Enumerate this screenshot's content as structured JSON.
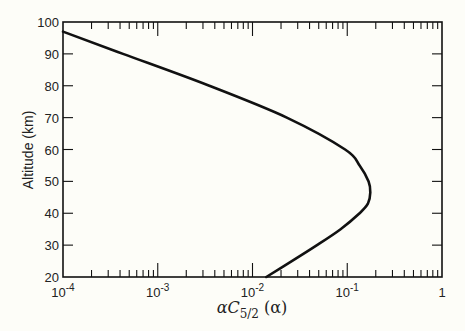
{
  "chart_data": {
    "type": "line",
    "title": "",
    "xlabel": "αC5/2(α)",
    "xlabel_parts": {
      "main": "αC",
      "sub": "5/2",
      "arg": " (α)"
    },
    "ylabel": "Altitude (km)",
    "xscale": "log",
    "xlim": [
      0.0001,
      1
    ],
    "ylim": [
      20,
      100
    ],
    "grid": false,
    "legend": null,
    "x_tick_labels": [
      {
        "base": "10",
        "exp": "-4",
        "value": 0.0001
      },
      {
        "base": "10",
        "exp": "-3",
        "value": 0.001
      },
      {
        "base": "10",
        "exp": "-2",
        "value": 0.01
      },
      {
        "base": "10",
        "exp": "-1",
        "value": 0.1
      },
      {
        "base": "1",
        "exp": "",
        "value": 1
      }
    ],
    "y_tick_labels": [
      "20",
      "30",
      "40",
      "50",
      "60",
      "70",
      "80",
      "90",
      "100"
    ],
    "y_ticks": [
      20,
      30,
      40,
      50,
      60,
      70,
      80,
      90,
      100
    ],
    "series": [
      {
        "name": "αC5/2(α) vs altitude",
        "color": "#111111",
        "points": [
          {
            "x": 0.0001,
            "y": 97
          },
          {
            "x": 0.00043,
            "y": 90
          },
          {
            "x": 0.0035,
            "y": 80
          },
          {
            "x": 0.023,
            "y": 70
          },
          {
            "x": 0.095,
            "y": 60
          },
          {
            "x": 0.135,
            "y": 55
          },
          {
            "x": 0.168,
            "y": 50
          },
          {
            "x": 0.175,
            "y": 46.5
          },
          {
            "x": 0.165,
            "y": 43
          },
          {
            "x": 0.135,
            "y": 40
          },
          {
            "x": 0.085,
            "y": 35
          },
          {
            "x": 0.048,
            "y": 30
          },
          {
            "x": 0.026,
            "y": 25
          },
          {
            "x": 0.014,
            "y": 20
          }
        ]
      }
    ]
  }
}
